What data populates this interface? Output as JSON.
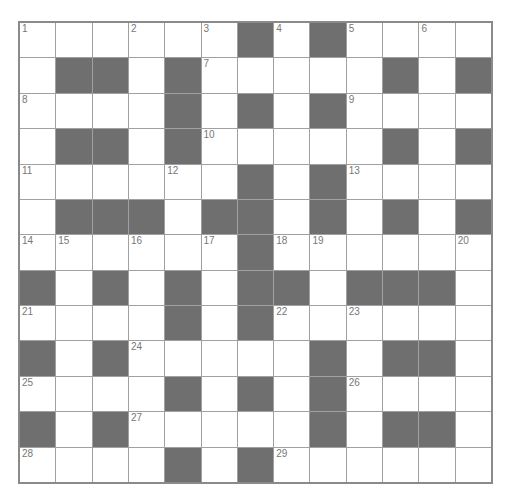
{
  "puzzle": {
    "rows": 13,
    "cols": 13,
    "colors": {
      "block": "#6f6f6f",
      "cell": "#ffffff",
      "gridline": "#a0a0a0",
      "number": "#777777"
    },
    "layout": [
      "......#.#....",
      ".##.#.....#.#",
      "....#.#.#....",
      ".##.#.....#.#",
      "......#.#....",
      ".###.##.#.#.#",
      "......#......",
      "#.#.#.##.###.",
      "....#.#......",
      "#.#.....#.##.",
      "....#.#.#....",
      "#.#.....#.##.",
      "....#.#......"
    ],
    "numbers": [
      {
        "row": 0,
        "col": 0,
        "n": "1"
      },
      {
        "row": 0,
        "col": 3,
        "n": "2"
      },
      {
        "row": 0,
        "col": 5,
        "n": "3"
      },
      {
        "row": 0,
        "col": 7,
        "n": "4"
      },
      {
        "row": 0,
        "col": 9,
        "n": "5"
      },
      {
        "row": 0,
        "col": 11,
        "n": "6"
      },
      {
        "row": 1,
        "col": 5,
        "n": "7"
      },
      {
        "row": 2,
        "col": 0,
        "n": "8"
      },
      {
        "row": 2,
        "col": 9,
        "n": "9"
      },
      {
        "row": 3,
        "col": 5,
        "n": "10"
      },
      {
        "row": 4,
        "col": 0,
        "n": "11"
      },
      {
        "row": 4,
        "col": 4,
        "n": "12"
      },
      {
        "row": 4,
        "col": 9,
        "n": "13"
      },
      {
        "row": 6,
        "col": 0,
        "n": "14"
      },
      {
        "row": 6,
        "col": 1,
        "n": "15"
      },
      {
        "row": 6,
        "col": 3,
        "n": "16"
      },
      {
        "row": 6,
        "col": 5,
        "n": "17"
      },
      {
        "row": 6,
        "col": 7,
        "n": "18"
      },
      {
        "row": 6,
        "col": 8,
        "n": "19"
      },
      {
        "row": 6,
        "col": 12,
        "n": "20"
      },
      {
        "row": 8,
        "col": 0,
        "n": "21"
      },
      {
        "row": 8,
        "col": 7,
        "n": "22"
      },
      {
        "row": 8,
        "col": 9,
        "n": "23"
      },
      {
        "row": 9,
        "col": 3,
        "n": "24"
      },
      {
        "row": 10,
        "col": 0,
        "n": "25"
      },
      {
        "row": 10,
        "col": 9,
        "n": "26"
      },
      {
        "row": 11,
        "col": 3,
        "n": "27"
      },
      {
        "row": 12,
        "col": 0,
        "n": "28"
      },
      {
        "row": 12,
        "col": 7,
        "n": "29"
      }
    ]
  }
}
